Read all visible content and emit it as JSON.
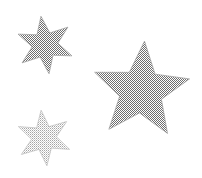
{
  "canvas": {
    "width": 202,
    "height": 178,
    "background_color": "#ffffff",
    "description": "Three gray halftone-dithered stars on a plain white background"
  },
  "palette": {
    "background": "#ffffff",
    "star_gray_dark": "#8f8f8f",
    "star_gray_light": "#b8b8b8",
    "edge_gray": "#9a9a9a",
    "edge_gray_light": "#bdbdbd"
  },
  "shapes": [
    {
      "id": "star-top-left",
      "name": "six-pointed-star",
      "points": 6,
      "fill_tone": "dark",
      "fill_color": "#8f8f8f",
      "center_x": 45,
      "center_y": 45,
      "outer_radius": 29,
      "inner_radius": 13,
      "rotation_deg": -8,
      "bounds": {
        "x": 17,
        "y": 16,
        "width": 57,
        "height": 60
      }
    },
    {
      "id": "star-bottom-left",
      "name": "six-pointed-star",
      "points": 6,
      "fill_tone": "light",
      "fill_color": "#b8b8b8",
      "center_x": 44,
      "center_y": 138,
      "outer_radius": 28,
      "inner_radius": 12.5,
      "rotation_deg": -6,
      "bounds": {
        "x": 18,
        "y": 110,
        "width": 54,
        "height": 57
      }
    },
    {
      "id": "star-right-large",
      "name": "five-pointed-star",
      "points": 5,
      "fill_tone": "dark",
      "fill_color": "#8f8f8f",
      "center_x": 141,
      "center_y": 91,
      "outer_radius": 50,
      "inner_radius": 22,
      "rotation_deg": 4,
      "bounds": {
        "x": 92,
        "y": 42,
        "width": 98,
        "height": 97
      }
    }
  ]
}
